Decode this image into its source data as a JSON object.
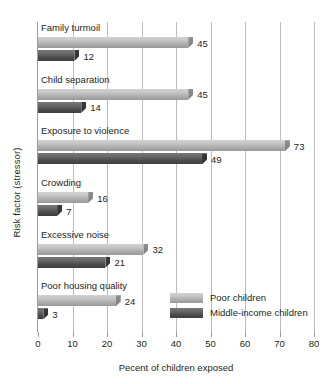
{
  "chart_data": {
    "type": "bar",
    "orientation": "horizontal",
    "title": "",
    "xlabel": "Pecent of children exposed",
    "ylabel": "Risk factor (stressor)",
    "xlim": [
      0,
      80
    ],
    "xticks": [
      0,
      10,
      20,
      30,
      40,
      50,
      60,
      70,
      80
    ],
    "grid": "vertical",
    "legend_position": "inside-bottom-right",
    "categories": [
      "Family turmoil",
      "Child separation",
      "Exposure to violence",
      "Crowding",
      "Excessive noise",
      "Poor housing quality"
    ],
    "series": [
      {
        "name": "Poor children",
        "color": "#c6c6c6",
        "values": [
          45,
          45,
          73,
          16,
          32,
          24
        ]
      },
      {
        "name": "Middle-income children",
        "color": "#5a5a5a",
        "values": [
          12,
          14,
          49,
          7,
          21,
          3
        ]
      }
    ]
  },
  "legend": {
    "items": [
      {
        "label": "Poor children",
        "swatch": "light"
      },
      {
        "label": "Middle-income children",
        "swatch": "dark"
      }
    ]
  }
}
